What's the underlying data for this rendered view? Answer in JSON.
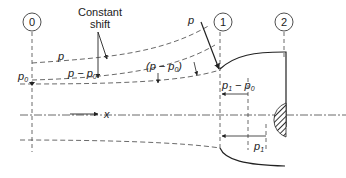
{
  "diagram": {
    "stations": [
      {
        "id": "station-0",
        "label": "0"
      },
      {
        "id": "station-1",
        "label": "1"
      },
      {
        "id": "station-2",
        "label": "2"
      }
    ],
    "annotations": {
      "constant_shift_line1": "Constant",
      "constant_shift_line2": "shift",
      "p_curve": "p",
      "p_minus_p0": "p − p",
      "p_minus_p0_sub": "0",
      "p_minus_p0_paren": "(p − p",
      "p_minus_p0_paren_sub": "0",
      "p_minus_p0_paren_close": ")",
      "p_top": "p",
      "p0": "p",
      "p0_sub": "0",
      "p1_minus_p0": "p",
      "p1_minus_p0_sub1": "1",
      "p1_minus_p0_mid": " − p",
      "p1_minus_p0_sub2": "0",
      "p1": "p",
      "p1_sub": "1",
      "x_axis": "x"
    },
    "colors": {
      "line": "#222222",
      "dash": "#444444",
      "hatch": "#333333"
    }
  }
}
